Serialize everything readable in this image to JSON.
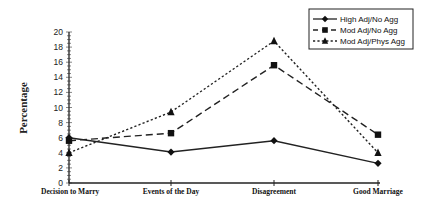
{
  "chart_data": {
    "type": "line",
    "title": "",
    "xlabel": "",
    "ylabel": "Percentage",
    "ylim": [
      0,
      20
    ],
    "yticks": [
      0,
      2,
      4,
      6,
      8,
      10,
      12,
      14,
      16,
      18,
      20
    ],
    "grid": false,
    "legend_position": "top-right",
    "categories": [
      "Decision to Marry",
      "Events of the Day",
      "Disagreement",
      "Good Marriage"
    ],
    "series": [
      {
        "name": "High Adj/No Agg",
        "marker": "diamond",
        "line": "solid",
        "values": [
          6.0,
          4.1,
          5.6,
          2.6
        ]
      },
      {
        "name": "Mod Adj/No Agg",
        "marker": "square",
        "line": "dashed",
        "values": [
          5.6,
          6.6,
          15.6,
          6.4
        ]
      },
      {
        "name": "Mod Adj/Phys Agg",
        "marker": "triangle",
        "line": "dotted",
        "values": [
          4.0,
          9.4,
          18.8,
          4.0
        ]
      }
    ]
  },
  "legend": {
    "items": [
      {
        "label": "High Adj/No Agg"
      },
      {
        "label": "Mod Adj/No Agg"
      },
      {
        "label": "Mod Adj/Phys Agg"
      }
    ]
  },
  "axis": {
    "ylabel": "Percentage"
  }
}
